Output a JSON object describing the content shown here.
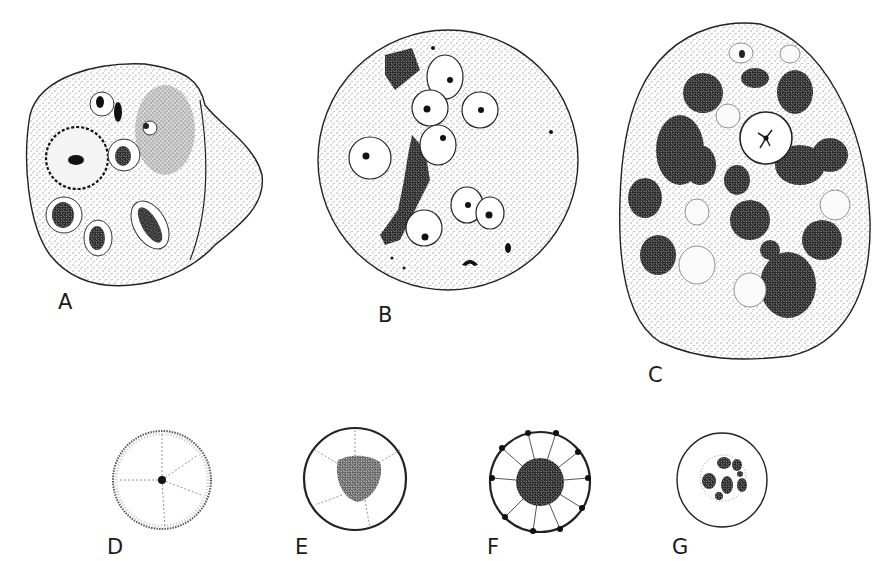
{
  "figure": {
    "panels": [
      {
        "id": "A",
        "label": "A",
        "description": "Irregular cell containing vacuoles with dark stained inclusions and a large nucleus with beaded membrane"
      },
      {
        "id": "B",
        "label": "B",
        "description": "Round cell with several pale nucleated cells and an elongated dark granular mass"
      },
      {
        "id": "C",
        "label": "C",
        "description": "Oval cell packed with many dark granular bodies and pale vacuoles, central clear body with star-shaped center"
      },
      {
        "id": "D",
        "label": "D",
        "description": "Small round body with central dot and faint radiating lines"
      },
      {
        "id": "E",
        "label": "E",
        "description": "Round body with granular central mass and radiating strands to thick margin"
      },
      {
        "id": "F",
        "label": "F",
        "description": "Round body with dark central granular mass, radiating septa and peripheral dots"
      },
      {
        "id": "G",
        "label": "G",
        "description": "Round body containing a cluster of small dark granular bodies"
      }
    ]
  }
}
